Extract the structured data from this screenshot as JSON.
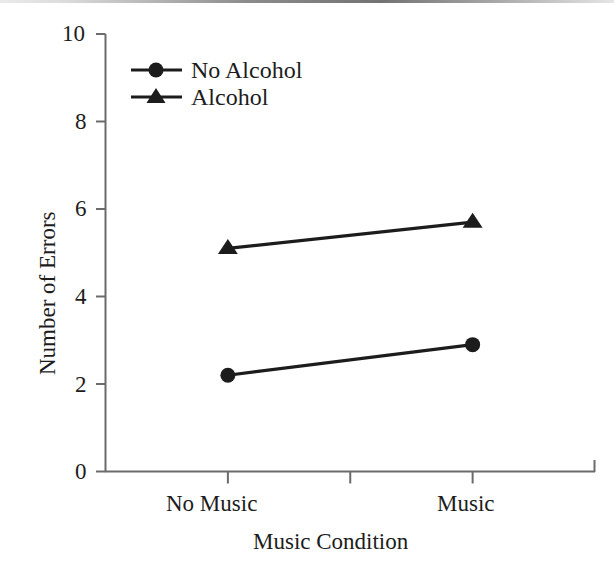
{
  "chart_data": {
    "type": "line",
    "title": "",
    "xlabel": "Music Condition",
    "ylabel": "Number of Errors",
    "categories": [
      "No Music",
      "Music"
    ],
    "x": [
      1,
      3
    ],
    "xlim": [
      0,
      4
    ],
    "ylim": [
      0,
      10
    ],
    "yticks": [
      0,
      2,
      4,
      6,
      8,
      10
    ],
    "ytick_labels": [
      "0",
      "2",
      "4",
      "6",
      "8",
      "10"
    ],
    "xtick_positions": [
      1,
      2,
      3
    ],
    "grid": false,
    "legend_position": "upper left inside",
    "series": [
      {
        "name": "No Alcohol",
        "marker": "circle",
        "values": [
          2.2,
          2.9
        ],
        "color": "#1c1c1c"
      },
      {
        "name": "Alcohol",
        "marker": "triangle",
        "values": [
          5.1,
          5.7
        ],
        "color": "#1c1c1c"
      }
    ]
  },
  "axes": {
    "y_tick_labels": [
      "10",
      "8",
      "6",
      "4",
      "2",
      "0"
    ],
    "x_tick_labels": [
      "No Music",
      "Music"
    ],
    "y_axis_title": "Number of Errors",
    "x_axis_title": "Music Condition"
  },
  "legend": {
    "entries": [
      {
        "label": "No Alcohol",
        "marker": "circle-marker"
      },
      {
        "label": "Alcohol",
        "marker": "triangle-marker"
      }
    ]
  },
  "colors": {
    "line": "#1c1c1c",
    "axis": "#6b6b6b",
    "text": "#1c1c1c",
    "background": "#ffffff"
  }
}
